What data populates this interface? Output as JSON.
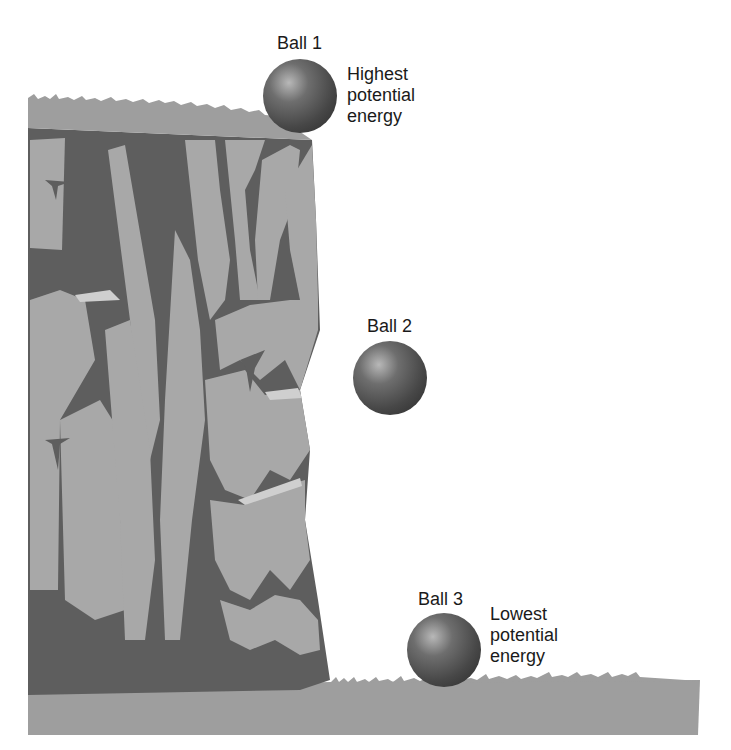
{
  "diagram": {
    "balls": [
      {
        "name": "Ball 1",
        "description": "Highest potential energy"
      },
      {
        "name": "Ball 2",
        "description": ""
      },
      {
        "name": "Ball 3",
        "description": "Lowest potential energy"
      }
    ],
    "labels": {
      "ball1_title": "Ball 1",
      "ball1_desc": [
        "Highest",
        "potential",
        "energy"
      ],
      "ball2_title": "Ball 2",
      "ball3_title": "Ball 3",
      "ball3_desc": [
        "Lowest",
        "potential",
        "energy"
      ]
    },
    "colors": {
      "rock_light": "#a8a8a8",
      "rock_dark": "#5e5e5e",
      "rock_highlight": "#cfcfcf",
      "ground": "#9e9e9e",
      "ball_base": "#4a4a4a",
      "ball_highlight": "#b5b5b5",
      "text": "#1a1a1a"
    }
  }
}
